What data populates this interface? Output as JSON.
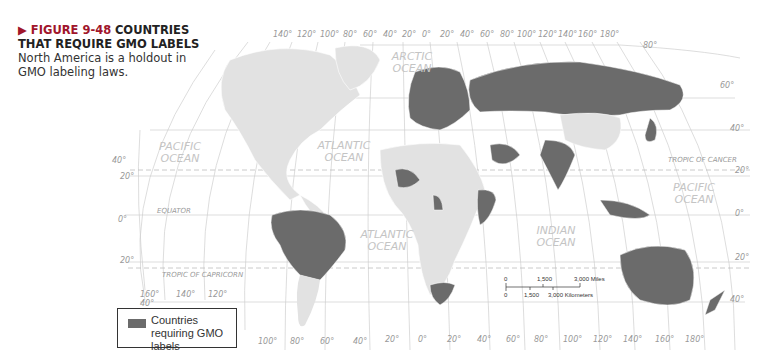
{
  "caption": {
    "figure": "▶ FIGURE 9-48",
    "title": "COUNTRIES THAT REQUIRE GMO LABELS",
    "body": "North America is a holdout in GMO labeling laws."
  },
  "map": {
    "top_longitudes": [
      "140°",
      "120°",
      "100°",
      "80°",
      "60°",
      "40°",
      "20°",
      "0°",
      "20°",
      "40°",
      "60°",
      "80°",
      "100°",
      "120°",
      "140°",
      "160°",
      "180°"
    ],
    "bottom_longitudes": [
      "160°",
      "140°",
      "120°",
      "100°",
      "80°",
      "60°",
      "40°",
      "20°",
      "0°",
      "20°",
      "40°",
      "60°",
      "80°",
      "100°",
      "120°",
      "140°",
      "160°",
      "180°"
    ],
    "latitudes_left": [
      "40°",
      "20°",
      "0°",
      "20°",
      "40°"
    ],
    "latitudes_right": [
      "80°",
      "60°",
      "40°",
      "20°",
      "0°",
      "20°",
      "40°"
    ],
    "lines": {
      "tropic_cancer": "TROPIC OF CANCER",
      "equator": "EQUATOR",
      "tropic_capricorn": "TROPIC OF CAPRICORN"
    },
    "oceans": {
      "arctic": [
        "ARCTIC",
        "OCEAN"
      ],
      "pacific_west": [
        "PACIFIC",
        "OCEAN"
      ],
      "atlantic_north": [
        "ATLANTIC",
        "OCEAN"
      ],
      "atlantic_south": [
        "ATLANTIC",
        "OCEAN"
      ],
      "indian": [
        "INDIAN",
        "OCEAN"
      ],
      "pacific_east": [
        "PACIFIC",
        "OCEAN"
      ]
    },
    "scale": {
      "miles": [
        "0",
        "1,500",
        "3,000 Miles"
      ],
      "km": [
        "0",
        "1,500",
        "3,000 Kilometers"
      ]
    },
    "colors": {
      "gmo": "#6b6b6b",
      "land": "#e2e2e2",
      "grid": "#c8c8c8"
    }
  },
  "legend": {
    "label": "Countries requiring GMO labels"
  }
}
